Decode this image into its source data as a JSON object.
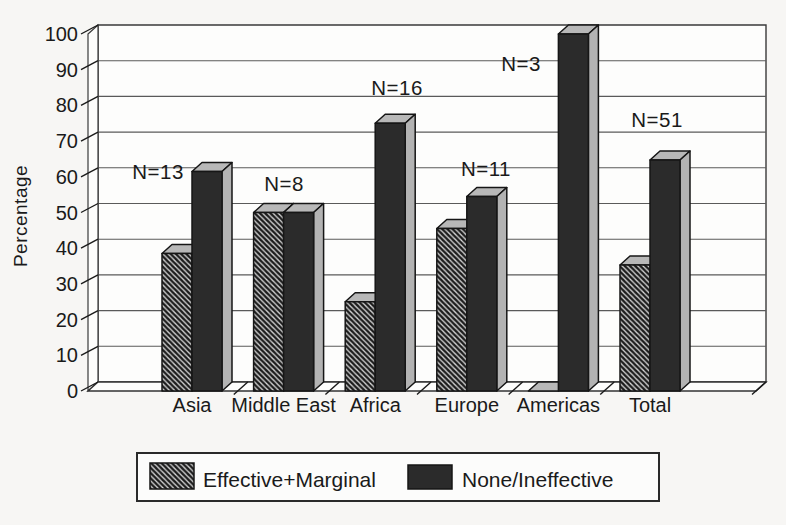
{
  "figure": {
    "kind": "scanned grayscale 3D grouped bar chart",
    "background": "#f7f6f4"
  },
  "chart_data": {
    "type": "bar",
    "variant": "3d-grouped-columns",
    "title": "",
    "xlabel": "",
    "ylabel": "Percentage",
    "ylim": [
      0,
      100
    ],
    "yticks": [
      0,
      10,
      20,
      30,
      40,
      50,
      60,
      70,
      80,
      90,
      100
    ],
    "grid": true,
    "legend_position": "bottom",
    "categories": [
      "Asia",
      "Middle East",
      "Africa",
      "Europe",
      "Americas",
      "Total"
    ],
    "series": [
      {
        "name": "Effective+Marginal",
        "style": "hatched",
        "values": [
          38.5,
          50,
          25,
          45.5,
          0,
          35.3
        ]
      },
      {
        "name": "None/Ineffective",
        "style": "solid-dark",
        "values": [
          61.5,
          50,
          75,
          54.5,
          100,
          64.7
        ]
      }
    ],
    "annotations": [
      {
        "text": "N=13",
        "category": "Asia"
      },
      {
        "text": "N=8",
        "category": "Middle East"
      },
      {
        "text": "N=16",
        "category": "Africa"
      },
      {
        "text": "N=11",
        "category": "Europe"
      },
      {
        "text": "N=3",
        "category": "Americas"
      },
      {
        "text": "N=51",
        "category": "Total"
      }
    ]
  },
  "colors": {
    "ink": "#1a1a1a",
    "plot_bg": "#fdfdfc",
    "grid_line": "#5a5a5a",
    "bar_dark_front": "#2b2b2b",
    "bar_dark_side": "#b3b3b3",
    "bar_top": "#b8b8b8",
    "hatch_bg": "#d6d6d6",
    "hatch_stripe": "#1d1d1d",
    "legend_bg": "#fcfcfb"
  }
}
